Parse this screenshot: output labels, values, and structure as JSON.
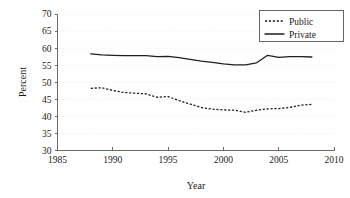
{
  "chart_data": {
    "type": "line",
    "title": "",
    "xlabel": "Year",
    "ylabel": "Percent",
    "xlim": [
      1985,
      2010
    ],
    "ylim": [
      30,
      70
    ],
    "xticks": [
      1985,
      1990,
      1995,
      2000,
      2005,
      2010
    ],
    "yticks": [
      30,
      35,
      40,
      45,
      50,
      55,
      60,
      65,
      70
    ],
    "grid": true,
    "legend_position": "top-right",
    "x": [
      1988,
      1989,
      1990,
      1991,
      1992,
      1993,
      1994,
      1995,
      1996,
      1997,
      1998,
      1999,
      2000,
      2001,
      2002,
      2003,
      2004,
      2005,
      2006,
      2007,
      2008
    ],
    "series": [
      {
        "name": "Public",
        "style": "dashed",
        "color": "#1f1f1f",
        "values": [
          48.2,
          48.4,
          47.6,
          47.0,
          46.8,
          46.6,
          45.6,
          45.8,
          44.6,
          43.6,
          42.6,
          42.1,
          41.9,
          41.8,
          41.2,
          41.8,
          42.2,
          42.3,
          42.6,
          43.3,
          43.5
        ]
      },
      {
        "name": "Private",
        "style": "solid",
        "color": "#1f1f1f",
        "values": [
          58.3,
          58.0,
          57.9,
          57.8,
          57.8,
          57.8,
          57.5,
          57.6,
          57.2,
          56.7,
          56.2,
          55.8,
          55.4,
          55.1,
          55.1,
          55.7,
          57.9,
          57.3,
          57.5,
          57.5,
          57.4
        ]
      }
    ]
  },
  "legend": {
    "items": [
      {
        "label": "Public"
      },
      {
        "label": "Private"
      }
    ]
  },
  "axes": {
    "y_title": "Percent",
    "x_title": "Year",
    "y_tick_labels": [
      "70",
      "65",
      "60",
      "55",
      "50",
      "45",
      "40",
      "35",
      "30"
    ],
    "x_tick_labels": [
      "1985",
      "1990",
      "1995",
      "2000",
      "2005",
      "2010"
    ]
  }
}
